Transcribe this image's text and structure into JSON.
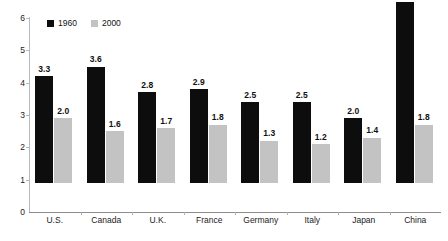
{
  "chart_data": {
    "type": "bar",
    "title": "",
    "subtitle": "",
    "xlabel": "",
    "ylabel": "",
    "ylim": [
      0,
      6
    ],
    "yticks": [
      "0",
      "1",
      "2",
      "3",
      "4",
      "5",
      "6"
    ],
    "grid": false,
    "legend_position": "top-left-inside",
    "categories": [
      "U.S.",
      "Canada",
      "U.K.",
      "France",
      "Germany",
      "Italy",
      "Japan",
      "China"
    ],
    "series": [
      {
        "name": "1960",
        "color": "#0d0d0d",
        "values": [
          3.3,
          3.6,
          2.8,
          2.9,
          2.5,
          2.5,
          2.0,
          5.6
        ],
        "labels": [
          "3.3",
          "3.6",
          "2.8",
          "2.9",
          "2.5",
          "2.5",
          "2.0",
          "5.6"
        ]
      },
      {
        "name": "2000",
        "color": "#c3c3c3",
        "values": [
          2.0,
          1.6,
          1.7,
          1.8,
          1.3,
          1.2,
          1.4,
          1.8
        ],
        "labels": [
          "2.0",
          "1.6",
          "1.7",
          "1.8",
          "1.3",
          "1.2",
          "1.4",
          "1.8"
        ]
      }
    ]
  },
  "legend": {
    "items": [
      {
        "label": "1960",
        "color": "#0d0d0d"
      },
      {
        "label": "2000",
        "color": "#c3c3c3"
      }
    ]
  },
  "axis": {
    "y_ticks": [
      "6",
      "5",
      "4",
      "3",
      "2",
      "1",
      "0"
    ],
    "x_categories": [
      "U.S.",
      "Canada",
      "U.K.",
      "France",
      "Germany",
      "Italy",
      "Japan",
      "China"
    ]
  },
  "colors": {
    "series_1960": "#0d0d0d",
    "series_2000": "#c3c3c3",
    "axis_line": "#b9b9b9",
    "baseline": "#8d8d8d",
    "text": "#111111",
    "background": "#ffffff"
  }
}
